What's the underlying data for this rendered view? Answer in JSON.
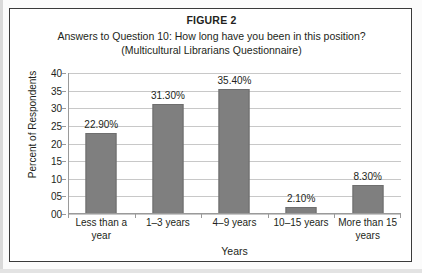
{
  "figure": {
    "title": "FIGURE 2",
    "subtitle_line1": "Answers to Question 10: How long have you been in this position?",
    "subtitle_line2": "(Multicultural Librarians Questionnaire)"
  },
  "colors": {
    "bar_fill": "#7f7f7f",
    "bar_border": "#6e6e6e",
    "gridline": "#c8c8c8",
    "axis": "#9a9a9a",
    "frame": "#3a3a3a",
    "text": "#231f20"
  },
  "chart_data": {
    "type": "bar",
    "title": "Answers to Question 10: How long have you been in this position?",
    "subtitle": "(Multicultural Librarians Questionnaire)",
    "xlabel": "Years",
    "ylabel": "Percent of Respondents",
    "categories": [
      "Less than a year",
      "1–3 years",
      "4–9 years",
      "10–15 years",
      "More than 15 years"
    ],
    "values": [
      22.9,
      31.3,
      35.4,
      2.1,
      8.3
    ],
    "data_labels": [
      "22.90%",
      "31.30%",
      "35.40%",
      "2.10%",
      "8.30%"
    ],
    "ylim": [
      0,
      40
    ],
    "ytick_values": [
      0,
      5,
      10,
      15,
      20,
      25,
      30,
      35,
      40
    ],
    "ytick_labels": [
      "00",
      "05",
      "10",
      "15",
      "20",
      "25",
      "30",
      "35",
      "40"
    ],
    "grid": true,
    "legend": false
  }
}
